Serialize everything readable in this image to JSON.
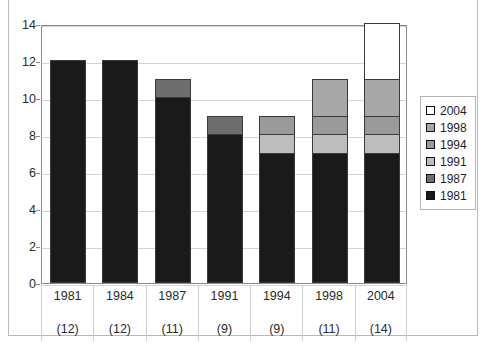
{
  "chart_data": {
    "type": "bar",
    "subtype": "stacked-vertical",
    "title": "",
    "subtitle": "",
    "xlabel": "",
    "ylabel": "",
    "ylim": [
      0,
      14
    ],
    "ytick_step": 2,
    "yticks": [
      "14",
      "12",
      "10",
      "8",
      "6",
      "4",
      "2",
      "0"
    ],
    "ytick_values": [
      14,
      12,
      10,
      8,
      6,
      4,
      2,
      0
    ],
    "grid": true,
    "grid_axis": "y",
    "legend_position": "right",
    "categories": [
      "1981",
      "1984",
      "1987",
      "1991",
      "1994",
      "1998",
      "2004"
    ],
    "category_counts": [
      "(12)",
      "(12)",
      "(11)",
      "(9)",
      "(9)",
      "(11)",
      "(14)"
    ],
    "category_totals": [
      12,
      12,
      11,
      9,
      9,
      11,
      14
    ],
    "series": [
      {
        "name": "1981",
        "color": "#1a1a1a",
        "values": [
          12,
          12,
          10,
          8,
          7,
          7,
          7
        ]
      },
      {
        "name": "1987",
        "color": "#6e6e6e",
        "values": [
          0,
          0,
          1,
          1,
          0,
          0,
          0
        ]
      },
      {
        "name": "1991",
        "color": "#bdbdbd",
        "values": [
          0,
          0,
          0,
          0,
          1,
          1,
          1
        ]
      },
      {
        "name": "1994",
        "color": "#9a9a9a",
        "values": [
          0,
          0,
          0,
          0,
          1,
          1,
          1
        ]
      },
      {
        "name": "1998",
        "color": "#a8a8a8",
        "values": [
          0,
          0,
          0,
          0,
          0,
          2,
          2
        ]
      },
      {
        "name": "2004",
        "color": "#ffffff",
        "values": [
          0,
          0,
          0,
          0,
          0,
          0,
          3
        ]
      }
    ],
    "legend_entries": [
      {
        "label": "2004",
        "color": "#ffffff"
      },
      {
        "label": "1998",
        "color": "#a8a8a8"
      },
      {
        "label": "1994",
        "color": "#9a9a9a"
      },
      {
        "label": "1991",
        "color": "#bdbdbd"
      },
      {
        "label": "1987",
        "color": "#6e6e6e"
      },
      {
        "label": "1981",
        "color": "#1a1a1a"
      }
    ]
  },
  "colors": {
    "plot_border": "#8c8c8c",
    "outer_border": "#b9b9b9",
    "gridline": "#d4d4d4",
    "bar_outline": "#3a3a3a",
    "text": "#2b2b2b"
  }
}
